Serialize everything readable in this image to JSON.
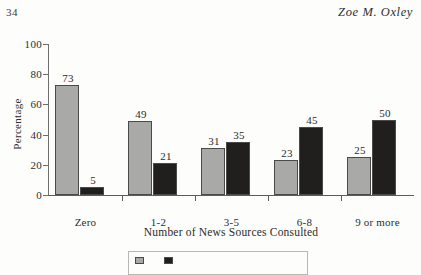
{
  "running_head": {
    "page_number": "34",
    "author": "Zoe M. Oxley"
  },
  "legend": {
    "entries": [
      {
        "label": "",
        "color": "#a9a9a7"
      },
      {
        "label": "",
        "color": "#211f1d"
      }
    ],
    "note": "legend box cut off at bottom edge of page"
  },
  "chart_data": {
    "type": "bar",
    "title": "",
    "xlabel": "Number of News Sources Consulted",
    "ylabel": "Percentage",
    "categories": [
      "Zero",
      "1-2",
      "3-5",
      "6-8",
      "9 or more"
    ],
    "yticks": [
      "100",
      "80",
      "60",
      "40",
      "20",
      "0"
    ],
    "ylim": [
      0,
      100
    ],
    "grid": false,
    "legend_position": "bottom-center",
    "series": [
      {
        "name": "",
        "color": "#a9a9a7",
        "values": [
          73,
          49,
          31,
          23,
          25
        ]
      },
      {
        "name": "",
        "color": "#211f1d",
        "values": [
          5,
          21,
          35,
          45,
          50
        ]
      }
    ]
  }
}
